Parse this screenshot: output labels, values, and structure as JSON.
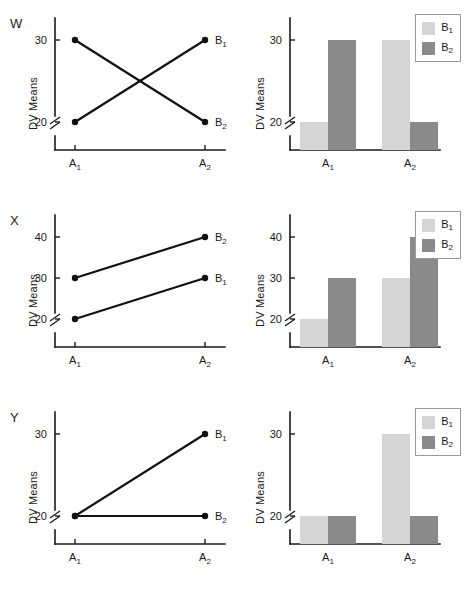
{
  "figure": {
    "axis_labels": {
      "y": "DV Means",
      "x_categories": [
        "A",
        "A"
      ]
    },
    "category_labels": [
      "A₁",
      "A₂"
    ],
    "series_labels": [
      "B₁",
      "B₂"
    ],
    "colors": {
      "b1": "#d5d5d5",
      "b2": "#8a8a8a",
      "line": "#111111",
      "axis": "#1a1a1a",
      "legend_border": "#9a9a9a"
    }
  },
  "legend": {
    "items": [
      {
        "label_main": "B",
        "label_sub": "1",
        "color": "#d5d5d5",
        "name": "b1"
      },
      {
        "label_main": "B",
        "label_sub": "2",
        "color": "#8a8a8a",
        "name": "b2"
      }
    ]
  },
  "panels": [
    {
      "letter": "W",
      "ylabel": "DV Means",
      "xticks": [
        "A₁",
        "A₂"
      ],
      "yticks": [
        "20",
        "30"
      ],
      "line_labels": [
        "B₁",
        "B₂"
      ],
      "chart_data": {
        "type": "line",
        "title": "W",
        "xlabel": "",
        "ylabel": "DV Means",
        "categories": [
          "A1",
          "A2"
        ],
        "ylim": [
          20,
          30
        ],
        "yticks": [
          20,
          30
        ],
        "axis_break": true,
        "grid": false,
        "legend_position": "right-of-points",
        "series": [
          {
            "name": "B1",
            "values": [
              20,
              30
            ]
          },
          {
            "name": "B2",
            "values": [
              30,
              20
            ]
          }
        ],
        "interaction": "crossover"
      },
      "bar_chart_data": {
        "type": "bar",
        "title": "W",
        "xlabel": "",
        "ylabel": "DV Means",
        "categories": [
          "A1",
          "A2"
        ],
        "ylim": [
          20,
          30
        ],
        "yticks": [
          20,
          30
        ],
        "axis_break": true,
        "grid": false,
        "legend_position": "top-right",
        "series": [
          {
            "name": "B1",
            "values": [
              20,
              30
            ],
            "color": "#d5d5d5"
          },
          {
            "name": "B2",
            "values": [
              30,
              20
            ],
            "color": "#8a8a8a"
          }
        ]
      }
    },
    {
      "letter": "X",
      "ylabel": "DV Means",
      "xticks": [
        "A₁",
        "A₂"
      ],
      "yticks": [
        "20",
        "30",
        "40"
      ],
      "line_labels": [
        "B₂",
        "B₁"
      ],
      "chart_data": {
        "type": "line",
        "title": "X",
        "xlabel": "",
        "ylabel": "DV Means",
        "categories": [
          "A1",
          "A2"
        ],
        "ylim": [
          20,
          40
        ],
        "yticks": [
          20,
          30,
          40
        ],
        "axis_break": true,
        "grid": false,
        "legend_position": "right-of-points",
        "series": [
          {
            "name": "B1",
            "values": [
              20,
              30
            ]
          },
          {
            "name": "B2",
            "values": [
              30,
              40
            ]
          }
        ],
        "interaction": "none-parallel"
      },
      "bar_chart_data": {
        "type": "bar",
        "title": "X",
        "xlabel": "",
        "ylabel": "DV Means",
        "categories": [
          "A1",
          "A2"
        ],
        "ylim": [
          20,
          40
        ],
        "yticks": [
          20,
          30,
          40
        ],
        "axis_break": true,
        "grid": false,
        "legend_position": "top-right",
        "series": [
          {
            "name": "B1",
            "values": [
              20,
              30
            ],
            "color": "#d5d5d5"
          },
          {
            "name": "B2",
            "values": [
              30,
              40
            ],
            "color": "#8a8a8a"
          }
        ]
      }
    },
    {
      "letter": "Y",
      "ylabel": "DV Means",
      "xticks": [
        "A₁",
        "A₂"
      ],
      "yticks": [
        "20",
        "30"
      ],
      "line_labels": [
        "B₁",
        "B₂"
      ],
      "chart_data": {
        "type": "line",
        "title": "Y",
        "xlabel": "",
        "ylabel": "DV Means",
        "categories": [
          "A1",
          "A2"
        ],
        "ylim": [
          20,
          30
        ],
        "yticks": [
          20,
          30
        ],
        "axis_break": true,
        "grid": false,
        "legend_position": "right-of-points",
        "series": [
          {
            "name": "B1",
            "values": [
              20,
              30
            ]
          },
          {
            "name": "B2",
            "values": [
              20,
              20
            ]
          }
        ],
        "interaction": "ordinal"
      },
      "bar_chart_data": {
        "type": "bar",
        "title": "Y",
        "xlabel": "",
        "ylabel": "DV Means",
        "categories": [
          "A1",
          "A2"
        ],
        "ylim": [
          20,
          30
        ],
        "yticks": [
          20,
          30
        ],
        "axis_break": true,
        "grid": false,
        "legend_position": "top-right",
        "series": [
          {
            "name": "B1",
            "values": [
              20,
              30
            ],
            "color": "#d5d5d5"
          },
          {
            "name": "B2",
            "values": [
              20,
              20
            ],
            "color": "#8a8a8a"
          }
        ]
      }
    }
  ]
}
